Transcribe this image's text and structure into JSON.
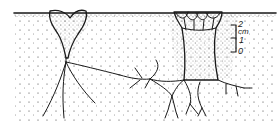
{
  "figure": {
    "type": "soil cross-section line drawing",
    "colors": {
      "ink": "#1a1a1a",
      "background": "#ffffff"
    },
    "structures": [
      {
        "name": "left-heart-shaped-cavity",
        "description": "heart-shaped hollow at soil surface with taproot and branching roots"
      },
      {
        "name": "right-columnar-cavity",
        "description": "wide columnar hollow with lobed crown at surface and branching roots"
      }
    ],
    "scale_bar": {
      "unit": "cm",
      "labels": {
        "top": "2",
        "unit": "cm",
        "middle": "1",
        "bottom": "0"
      }
    }
  }
}
